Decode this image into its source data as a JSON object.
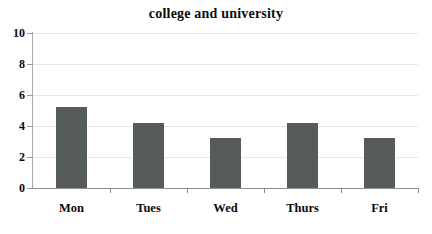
{
  "chart_data": {
    "type": "bar",
    "title": "college and university",
    "xlabel": "",
    "ylabel": "",
    "categories": [
      "Mon",
      "Tues",
      "Wed",
      "Thurs",
      "Fri"
    ],
    "values": [
      5.2,
      4.2,
      3.2,
      4.2,
      3.2
    ],
    "series": [
      {
        "name": "college and university",
        "values": [
          5.2,
          4.2,
          3.2,
          4.2,
          3.2
        ]
      }
    ],
    "ylim": [
      0,
      10
    ],
    "yticks": [
      0,
      2,
      4,
      6,
      8,
      10
    ],
    "ytick_labels": [
      "0",
      "2",
      "4",
      "6",
      "8",
      "10"
    ],
    "grid": true,
    "grid_axis": "y",
    "legend": false,
    "legend_position": "none",
    "bar_color": "#565b5b",
    "gridline_color": "#e8e8e8",
    "axis_color": "#6d6d6d",
    "background_color": "#ffffff",
    "text_color": "#0b0b0b"
  }
}
